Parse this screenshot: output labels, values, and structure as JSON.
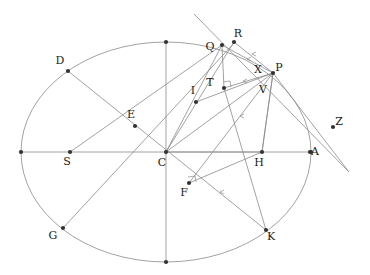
{
  "figure": {
    "background_color": "#ffffff",
    "stroke_color": "#8a8a8a",
    "point_color": "#333333",
    "label_color": "#1a1a1a",
    "width": 370,
    "height": 275
  },
  "chart_data": {
    "type": "scatter",
    "xlabel": "",
    "ylabel": "",
    "grid": false,
    "legend": null,
    "ellipse": {
      "center_label": "C",
      "cx": 166,
      "cy": 152,
      "rx": 145,
      "ry": 110
    },
    "labels": [
      "D",
      "E",
      "S",
      "C",
      "G",
      "I",
      "T",
      "Q",
      "R",
      "P",
      "X",
      "V",
      "H",
      "A",
      "Z",
      "F",
      "K"
    ],
    "points": [
      {
        "name": "D",
        "x": 68,
        "y": 71,
        "label_dx": -8,
        "label_dy": -7,
        "on_ellipse": true
      },
      {
        "name": "E",
        "x": 135,
        "y": 126,
        "label_dx": -4,
        "label_dy": -8,
        "on_ellipse": false
      },
      {
        "name": "S",
        "x": 70,
        "y": 152,
        "label_dx": -3,
        "label_dy": 13,
        "on_ellipse": false
      },
      {
        "name": "C",
        "x": 166,
        "y": 152,
        "label_dx": -4,
        "label_dy": 14,
        "on_ellipse": false
      },
      {
        "name": "G",
        "x": 63,
        "y": 228,
        "label_dx": -10,
        "label_dy": 11,
        "on_ellipse": true
      },
      {
        "name": "I",
        "x": 196,
        "y": 102,
        "label_dx": -3,
        "label_dy": -8,
        "on_ellipse": false
      },
      {
        "name": "T",
        "x": 224,
        "y": 88,
        "label_dx": -14,
        "label_dy": -2,
        "on_ellipse": false
      },
      {
        "name": "Q",
        "x": 222,
        "y": 45,
        "label_dx": -12,
        "label_dy": 5,
        "on_ellipse": true
      },
      {
        "name": "R",
        "x": 234,
        "y": 42,
        "label_dx": 4,
        "label_dy": -5,
        "on_ellipse": false
      },
      {
        "name": "P",
        "x": 273,
        "y": 73,
        "label_dx": 6,
        "label_dy": -2,
        "on_ellipse": true
      },
      {
        "name": "X",
        "x": 264,
        "y": 76,
        "label_dx": -6,
        "label_dy": -3,
        "on_ellipse": false,
        "dot": false
      },
      {
        "name": "V",
        "x": 266,
        "y": 82,
        "label_dx": -3,
        "label_dy": 11,
        "on_ellipse": false,
        "dot": false
      },
      {
        "name": "H",
        "x": 262,
        "y": 152,
        "label_dx": -3,
        "label_dy": 14,
        "on_ellipse": false
      },
      {
        "name": "A",
        "x": 310,
        "y": 152,
        "label_dx": 5,
        "label_dy": 3,
        "on_ellipse": true
      },
      {
        "name": "Z",
        "x": 333,
        "y": 127,
        "label_dx": 6,
        "label_dy": -2,
        "on_ellipse": false
      },
      {
        "name": "F",
        "x": 189,
        "y": 183,
        "label_dx": -5,
        "label_dy": 13,
        "on_ellipse": false
      },
      {
        "name": "K",
        "x": 266,
        "y": 230,
        "label_dx": 5,
        "label_dy": 10,
        "on_ellipse": true
      }
    ],
    "vertices": [
      {
        "name": "left-vertex",
        "x": 21,
        "y": 152
      },
      {
        "name": "right-vertex",
        "x": 311,
        "y": 152
      },
      {
        "name": "top-vertex",
        "x": 166,
        "y": 42
      },
      {
        "name": "bottom-vertex",
        "x": 166,
        "y": 262
      }
    ],
    "segments": [
      {
        "name": "major-axis",
        "x1": 21,
        "y1": 152,
        "x2": 311,
        "y2": 152
      },
      {
        "name": "minor-axis",
        "x1": 166,
        "y1": 42,
        "x2": 166,
        "y2": 262
      },
      {
        "name": "D-to-K",
        "x1": 68,
        "y1": 71,
        "x2": 266,
        "y2": 230
      },
      {
        "name": "G-to-R",
        "x1": 63,
        "y1": 228,
        "x2": 236,
        "y2": 41
      },
      {
        "name": "S-to-Q",
        "x1": 70,
        "y1": 152,
        "x2": 222,
        "y2": 45
      },
      {
        "name": "I-to-P",
        "x1": 196,
        "y1": 102,
        "x2": 273,
        "y2": 73
      },
      {
        "name": "C-to-P",
        "x1": 166,
        "y1": 152,
        "x2": 273,
        "y2": 73
      },
      {
        "name": "C-to-Q",
        "x1": 166,
        "y1": 152,
        "x2": 222,
        "y2": 45
      },
      {
        "name": "C-to-R",
        "x1": 166,
        "y1": 152,
        "x2": 234,
        "y2": 42
      },
      {
        "name": "Q-to-T",
        "x1": 222,
        "y1": 45,
        "x2": 224,
        "y2": 88
      },
      {
        "name": "Q-to-P",
        "x1": 222,
        "y1": 45,
        "x2": 273,
        "y2": 73
      },
      {
        "name": "R-to-P",
        "x1": 234,
        "y1": 42,
        "x2": 273,
        "y2": 73
      },
      {
        "name": "T-to-P",
        "x1": 224,
        "y1": 88,
        "x2": 273,
        "y2": 73
      },
      {
        "name": "H-to-P",
        "x1": 262,
        "y1": 152,
        "x2": 273,
        "y2": 73
      },
      {
        "name": "C-to-H-arrowline",
        "x1": 166,
        "y1": 152,
        "x2": 262,
        "y2": 152
      },
      {
        "name": "P-to-H-chord",
        "x1": 273,
        "y1": 73,
        "x2": 262,
        "y2": 152
      },
      {
        "name": "tangent-line",
        "x1": 194,
        "y1": 14,
        "x2": 349,
        "y2": 172
      },
      {
        "name": "P-to-Z",
        "x1": 273,
        "y1": 73,
        "x2": 349,
        "y2": 172
      },
      {
        "name": "F-to-H",
        "x1": 189,
        "y1": 183,
        "x2": 262,
        "y2": 152
      },
      {
        "name": "P-to-F",
        "x1": 273,
        "y1": 73,
        "x2": 189,
        "y2": 183
      },
      {
        "name": "T-to-K",
        "x1": 224,
        "y1": 88,
        "x2": 266,
        "y2": 230
      }
    ],
    "right_angle_marks": [
      {
        "name": "right-angle-at-T",
        "x": 224,
        "y": 88
      },
      {
        "name": "right-angle-at-F",
        "x": 189,
        "y": 183
      }
    ],
    "tick_marks": [
      {
        "name": "tick-on-QP",
        "x": 247,
        "y": 59
      },
      {
        "name": "tick-on-RP",
        "x": 252,
        "y": 54
      },
      {
        "name": "tick-on-TP",
        "x": 243,
        "y": 81
      },
      {
        "name": "tick-on-PH-upper",
        "x": 240,
        "y": 116
      },
      {
        "name": "tick-on-PF",
        "x": 220,
        "y": 192
      }
    ]
  }
}
